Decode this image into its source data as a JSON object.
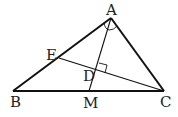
{
  "diagram": {
    "type": "geometry-triangle",
    "points": {
      "A": {
        "label": "A",
        "x": 111,
        "y": 18
      },
      "B": {
        "label": "B",
        "x": 13,
        "y": 91
      },
      "C": {
        "label": "C",
        "x": 164,
        "y": 91
      },
      "E": {
        "label": "E",
        "x": 59,
        "y": 58
      },
      "D": {
        "label": "D",
        "x": 97,
        "y": 70
      },
      "M": {
        "label": "M",
        "x": 89,
        "y": 91
      }
    },
    "segments": [
      "AB",
      "BC",
      "CA",
      "AM",
      "CE"
    ],
    "annotations": [
      {
        "type": "angle-bisector-marks",
        "at": "A",
        "note": "angle BAM = angle MAC"
      },
      {
        "type": "right-angle",
        "at": "D",
        "note": "CE perpendicular to AM"
      }
    ],
    "colors": {
      "line": "#111111",
      "label": "#222222",
      "background": "#ffffff"
    }
  }
}
